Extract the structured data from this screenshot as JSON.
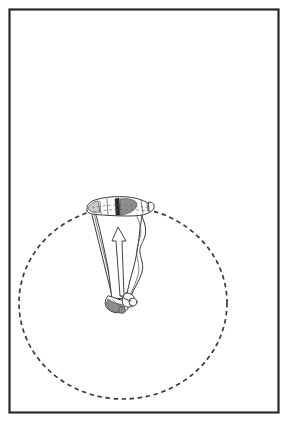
{
  "document": {
    "title": "Paraglider turn diagram",
    "background_color": "#ffffff"
  },
  "frame": {
    "name": "figure-border",
    "stroke_color": "#2b2b2b",
    "x": 9,
    "y": 9,
    "width": 269,
    "height": 403
  },
  "illustration": {
    "subject": "paraglider wing with pilot harness and lines",
    "view": "front three-quarter",
    "ink_color": "#3a3a3a",
    "parts": [
      {
        "id": "canopy",
        "label": "wing canopy"
      },
      {
        "id": "canopy-shading",
        "label": "canopy shading band"
      },
      {
        "id": "canopy-dashed-seam",
        "label": "canopy chord seam"
      },
      {
        "id": "riser-lines",
        "label": "suspension lines"
      },
      {
        "id": "pilot-harness",
        "label": "pilot harness"
      },
      {
        "id": "direction-arrow",
        "label": "direction of travel arrow"
      }
    ]
  },
  "orbit": {
    "name": "turn-radius-circle",
    "style": "dashed",
    "stroke_color": "#3a3a3a",
    "center_x": 123,
    "center_y": 303,
    "radius_x": 104,
    "radius_y": 96
  },
  "chart_data": {
    "type": "scatter",
    "title": "Paraglider turn diagram",
    "xlabel": "",
    "ylabel": "",
    "annotations": [
      "dashed circle indicating turn radius",
      "arrow indicating direction of flight"
    ]
  }
}
